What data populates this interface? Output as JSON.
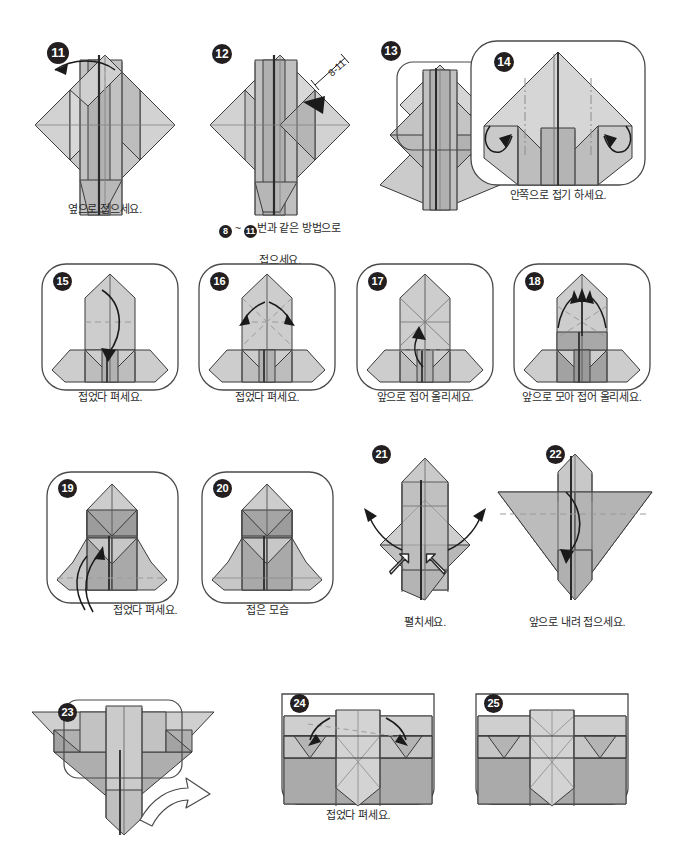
{
  "document": {
    "type": "origami-instruction-diagram",
    "language": "ko",
    "page_background": "#ffffff",
    "palette": {
      "paper_light": "#dcdcdc",
      "paper_mid": "#bfbfbf",
      "paper_dark": "#a3a3a3",
      "paper_darker": "#8f8f8f",
      "outline": "#3a3a3a",
      "crease": "#8a8a8a",
      "dashed": "#9a9a9a",
      "badge_fill": "#231f20",
      "badge_text": "#ffffff",
      "caption_text": "#2b2b2b",
      "frame_stroke": "#4a4a4a"
    }
  },
  "steps": [
    {
      "number": "11",
      "caption": "옆으로 접으세요.",
      "framed": false,
      "arrows": [
        "fold-left-valley"
      ]
    },
    {
      "number": "12",
      "caption": "❽ ~ ⓫번과 같은 방법으로\n접으세요.",
      "caption_parts": [
        {
          "badge": "8"
        },
        {
          "text": " ~ "
        },
        {
          "badge": "11"
        },
        {
          "text": "번과 같은 방법으로"
        }
      ],
      "caption_line2": "접으세요.",
      "framed": false,
      "annotation_label": "8-11",
      "arrows": [
        "point-left"
      ]
    },
    {
      "number": "13",
      "caption": "",
      "framed": false,
      "zoom_box": true,
      "transition_arrow": true
    },
    {
      "number": "14",
      "caption": "안쪽으로 접기 하세요.",
      "framed": true,
      "arrows": [
        "inside-fold-left",
        "inside-fold-right"
      ]
    },
    {
      "number": "15",
      "caption": "접었다 펴세요.",
      "framed": true,
      "arrows": [
        "fold-down-curve"
      ]
    },
    {
      "number": "16",
      "caption": "접었다 펴세요.",
      "framed": true,
      "arrows": [
        "fold-out-left",
        "fold-out-right"
      ]
    },
    {
      "number": "17",
      "caption": "앞으로 접어 올리세요.",
      "framed": true,
      "arrows": [
        "fold-up"
      ]
    },
    {
      "number": "18",
      "caption": "앞으로 모아 접어 올리세요.",
      "framed": true,
      "arrows": [
        "fold-up-left",
        "fold-up-center",
        "fold-up-right"
      ]
    },
    {
      "number": "19",
      "caption": "접었다 펴세요.",
      "framed": true,
      "arrows": [
        "fold-up-long"
      ]
    },
    {
      "number": "20",
      "caption": "접은 모습",
      "framed": true,
      "arrows": []
    },
    {
      "number": "21",
      "caption": "펼치세요.",
      "framed": false,
      "arrows": [
        "spread-left",
        "spread-right",
        "push-left",
        "push-right"
      ]
    },
    {
      "number": "22",
      "caption": "앞으로 내려 접으세요.",
      "framed": false,
      "arrows": [
        "fold-down"
      ]
    },
    {
      "number": "23",
      "caption": "",
      "framed": false,
      "zoom_box": true,
      "transition_arrow": true
    },
    {
      "number": "24",
      "caption": "접었다 펴세요.",
      "framed": true,
      "arrows": [
        "fold-in-left",
        "fold-in-right"
      ]
    },
    {
      "number": "25",
      "caption": "",
      "framed": true,
      "arrows": []
    }
  ]
}
